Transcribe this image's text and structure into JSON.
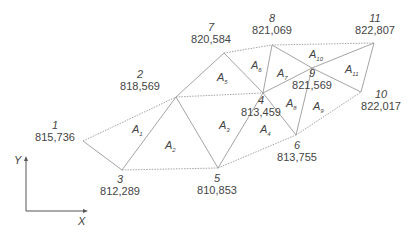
{
  "nodes": [
    {
      "id": "1",
      "value": "815,736",
      "x": 83,
      "y": 141
    },
    {
      "id": "2",
      "value": "818,569",
      "x": 176,
      "y": 97
    },
    {
      "id": "3",
      "value": "812,289",
      "x": 122,
      "y": 170
    },
    {
      "id": "4",
      "value": "813,459",
      "x": 263,
      "y": 93
    },
    {
      "id": "5",
      "value": "810,853",
      "x": 218,
      "y": 168
    },
    {
      "id": "6",
      "value": "813,755",
      "x": 296,
      "y": 135
    },
    {
      "id": "7",
      "value": "820,584",
      "x": 224,
      "y": 53
    },
    {
      "id": "8",
      "value": "821,069",
      "x": 272,
      "y": 45
    },
    {
      "id": "9",
      "value": "821,569",
      "x": 312,
      "y": 68
    },
    {
      "id": "10",
      "value": "822,017",
      "x": 361,
      "y": 92
    },
    {
      "id": "11",
      "value": "822,807",
      "x": 374,
      "y": 43
    }
  ],
  "edges": [
    [
      "1",
      "2",
      "dotted"
    ],
    [
      "1",
      "3",
      "solid"
    ],
    [
      "2",
      "3",
      "solid"
    ],
    [
      "3",
      "5",
      "dotted"
    ],
    [
      "2",
      "5",
      "solid"
    ],
    [
      "2",
      "4",
      "dotted"
    ],
    [
      "2",
      "7",
      "solid"
    ],
    [
      "4",
      "5",
      "solid"
    ],
    [
      "5",
      "6",
      "dotted"
    ],
    [
      "4",
      "6",
      "solid"
    ],
    [
      "4",
      "7",
      "solid"
    ],
    [
      "7",
      "8",
      "dotted"
    ],
    [
      "4",
      "8",
      "solid"
    ],
    [
      "8",
      "9",
      "solid"
    ],
    [
      "4",
      "9",
      "solid"
    ],
    [
      "9",
      "6",
      "solid"
    ],
    [
      "9",
      "10",
      "solid"
    ],
    [
      "6",
      "10",
      "dotted"
    ],
    [
      "8",
      "11",
      "dotted"
    ],
    [
      "9",
      "11",
      "solid"
    ],
    [
      "10",
      "11",
      "solid"
    ]
  ],
  "areas": [
    {
      "base": "A",
      "sub": "1",
      "x": 132,
      "y": 124
    },
    {
      "base": "A",
      "sub": "2",
      "x": 165,
      "y": 140
    },
    {
      "base": "A",
      "sub": "3",
      "x": 219,
      "y": 120
    },
    {
      "base": "A",
      "sub": "4",
      "x": 260,
      "y": 124
    },
    {
      "base": "A",
      "sub": "5",
      "x": 217,
      "y": 72
    },
    {
      "base": "A",
      "sub": "6",
      "x": 251,
      "y": 60
    },
    {
      "base": "A",
      "sub": "7",
      "x": 277,
      "y": 68
    },
    {
      "base": "A",
      "sub": "8",
      "x": 286,
      "y": 98
    },
    {
      "base": "A",
      "sub": "9",
      "x": 313,
      "y": 101
    },
    {
      "base": "A",
      "sub": "10",
      "x": 309,
      "y": 49
    },
    {
      "base": "A",
      "sub": "11",
      "x": 345,
      "y": 64
    }
  ],
  "axes": {
    "x_label": "X",
    "y_label": "Y"
  },
  "colors": {
    "line": "#9a9a9a",
    "text": "#444444"
  }
}
